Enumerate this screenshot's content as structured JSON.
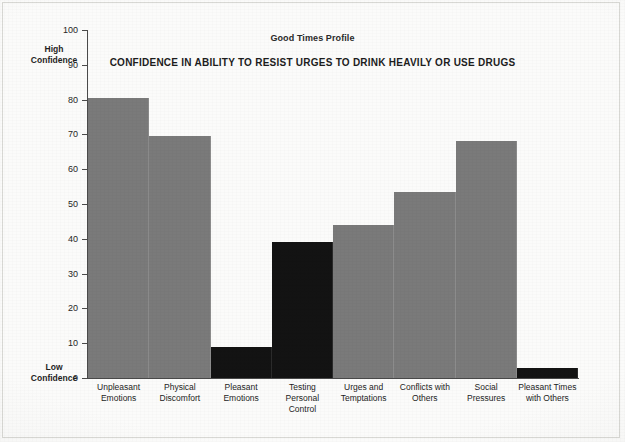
{
  "chart_data": {
    "type": "bar",
    "title": "CONFIDENCE IN ABILITY TO RESIST URGES TO DRINK HEAVILY OR USE DRUGS",
    "subtitle": "Good Times Profile",
    "xlabel": "",
    "ylabel": "",
    "ylim": [
      0,
      100
    ],
    "ytick_labels": [
      "100",
      "90",
      "80",
      "70",
      "60",
      "50",
      "40",
      "30",
      "20",
      "10",
      "0"
    ],
    "yticks": [
      100,
      90,
      80,
      70,
      60,
      50,
      40,
      30,
      20,
      10,
      0
    ],
    "grid": false,
    "legend": "none",
    "axis_low_label": "Low\nConfidence",
    "axis_high_label": "High\nConfidence",
    "categories": [
      "Unpleasant Emotions",
      "Physical Discomfort",
      "Pleasant Emotions",
      "Testing Personal Control",
      "Urges and Temptations",
      "Conflicts with Others",
      "Social Pressures",
      "Pleasant Times with Others"
    ],
    "values": [
      80.5,
      69.5,
      9,
      39,
      44,
      53.5,
      68,
      3
    ],
    "bar_colors": [
      "#7a7a7a",
      "#7a7a7a",
      "#131313",
      "#131313",
      "#7a7a7a",
      "#7a7a7a",
      "#7a7a7a",
      "#131313"
    ],
    "colors": {
      "bar_gray": "#7a7a7a",
      "bar_dark": "#131313",
      "axis": "#4a4a4a",
      "text": "#1d1d1d",
      "background": "#fbfbfa"
    }
  },
  "axis": {
    "high_confidence_line1": "High",
    "high_confidence_line2": "Confidence",
    "low_confidence_line1": "Low",
    "low_confidence_line2": "Confidence"
  },
  "x_labels": [
    {
      "line1": "Unpleasant",
      "line2": "Emotions"
    },
    {
      "line1": "Physical",
      "line2": "Discomfort"
    },
    {
      "line1": "Pleasant",
      "line2": "Emotions"
    },
    {
      "line1": "Testing Personal",
      "line2": "Control"
    },
    {
      "line1": "Urges and",
      "line2": "Temptations"
    },
    {
      "line1": "Conflicts with",
      "line2": "Others"
    },
    {
      "line1": "Social Pressures",
      "line2": ""
    },
    {
      "line1": "Pleasant Times",
      "line2": "with Others"
    }
  ]
}
